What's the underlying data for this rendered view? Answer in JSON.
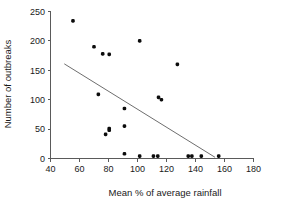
{
  "chart_data": {
    "type": "scatter",
    "title": "",
    "xlabel": "Mean % of average rainfall",
    "ylabel": "Number of outbreaks",
    "xlim": [
      40,
      180
    ],
    "ylim": [
      0,
      250
    ],
    "xticks": [
      40,
      60,
      80,
      100,
      120,
      140,
      160,
      180
    ],
    "yticks": [
      0,
      50,
      100,
      150,
      200,
      250
    ],
    "xticklabels": [
      "40",
      "60",
      "80",
      "100",
      "120",
      "140",
      "160",
      "180"
    ],
    "yticklabels": [
      "0",
      "50",
      "100",
      "150",
      "200",
      "250"
    ],
    "grid": false,
    "legend": null,
    "points": [
      {
        "x": 55.5,
        "y": 234
      },
      {
        "x": 70.0,
        "y": 190
      },
      {
        "x": 76.0,
        "y": 178
      },
      {
        "x": 80.5,
        "y": 177
      },
      {
        "x": 101.5,
        "y": 200
      },
      {
        "x": 127.5,
        "y": 160
      },
      {
        "x": 73.0,
        "y": 109
      },
      {
        "x": 114.5,
        "y": 104
      },
      {
        "x": 116.5,
        "y": 100
      },
      {
        "x": 91.0,
        "y": 85
      },
      {
        "x": 91.0,
        "y": 55
      },
      {
        "x": 80.5,
        "y": 51
      },
      {
        "x": 80.5,
        "y": 48
      },
      {
        "x": 78.0,
        "y": 41
      },
      {
        "x": 91.0,
        "y": 8
      },
      {
        "x": 101.5,
        "y": 4
      },
      {
        "x": 111.0,
        "y": 4
      },
      {
        "x": 114.0,
        "y": 4
      },
      {
        "x": 135.0,
        "y": 4
      },
      {
        "x": 137.5,
        "y": 4
      },
      {
        "x": 144.0,
        "y": 4
      },
      {
        "x": 156.0,
        "y": 4
      }
    ],
    "trendline": {
      "x_start": 49.5,
      "y_start": 161,
      "x_end": 153.5,
      "y_end": 2
    }
  },
  "axes": {
    "x_axis_name": "x-axis",
    "y_axis_name": "y-axis"
  }
}
